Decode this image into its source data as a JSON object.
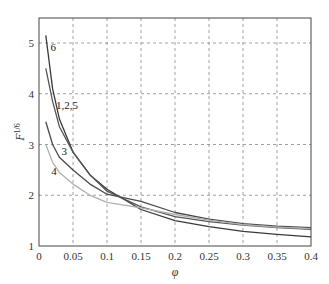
{
  "chart_data": {
    "type": "line",
    "title": "",
    "xlabel": "φ",
    "ylabel": "F^{1/6}",
    "xlim": [
      0,
      0.4
    ],
    "ylim": [
      1,
      5.5
    ],
    "grid": true,
    "grid_style": "dashed",
    "legend": "inline curve labels",
    "x_ticks": [
      "0",
      "0.05",
      "0.1",
      "0.15",
      "0.2",
      "0.25",
      "0.3",
      "0.35",
      "0.4"
    ],
    "y_ticks": [
      "1",
      "2",
      "3",
      "4",
      "5"
    ],
    "x": [
      0.01,
      0.02,
      0.03,
      0.05,
      0.075,
      0.1,
      0.15,
      0.2,
      0.25,
      0.3,
      0.35,
      0.4
    ],
    "series": [
      {
        "name": "6",
        "color": "#3a3a3a",
        "values": [
          5.15,
          4.1,
          3.5,
          2.85,
          2.4,
          2.12,
          1.72,
          1.5,
          1.38,
          1.29,
          1.23,
          1.18
        ]
      },
      {
        "name": "1,2,5",
        "color": "#555555",
        "values": [
          4.5,
          3.85,
          3.35,
          2.85,
          2.4,
          2.08,
          1.77,
          1.58,
          1.48,
          1.41,
          1.36,
          1.33
        ]
      },
      {
        "name": "3",
        "color": "#4a4a4a",
        "values": [
          3.45,
          3.0,
          2.75,
          2.5,
          2.22,
          2.02,
          1.88,
          1.66,
          1.53,
          1.44,
          1.39,
          1.36
        ]
      },
      {
        "name": "4",
        "color": "#b0b0b0",
        "values": [
          3.0,
          2.65,
          2.45,
          2.22,
          2.0,
          1.86,
          1.75,
          1.62,
          1.51,
          1.42,
          1.37,
          1.34
        ]
      }
    ],
    "annotations": [
      {
        "text": "6",
        "x": 0.017,
        "y": 4.85
      },
      {
        "text": "1,2,5",
        "x": 0.025,
        "y": 3.7
      },
      {
        "text": "3",
        "x": 0.033,
        "y": 2.8
      },
      {
        "text": "4",
        "x": 0.018,
        "y": 2.4
      }
    ]
  }
}
